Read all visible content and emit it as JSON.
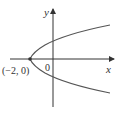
{
  "diagram": {
    "type": "parabola-graph",
    "axes": {
      "x_label": "x",
      "y_label": "y",
      "origin_label": "0"
    },
    "vertex": {
      "label": "(−2, 0)",
      "x": -2,
      "y": 0
    },
    "curve": "parabola opening to the right",
    "colors": {
      "axis": "#333333",
      "curve": "#555555",
      "point": "#333333"
    }
  }
}
